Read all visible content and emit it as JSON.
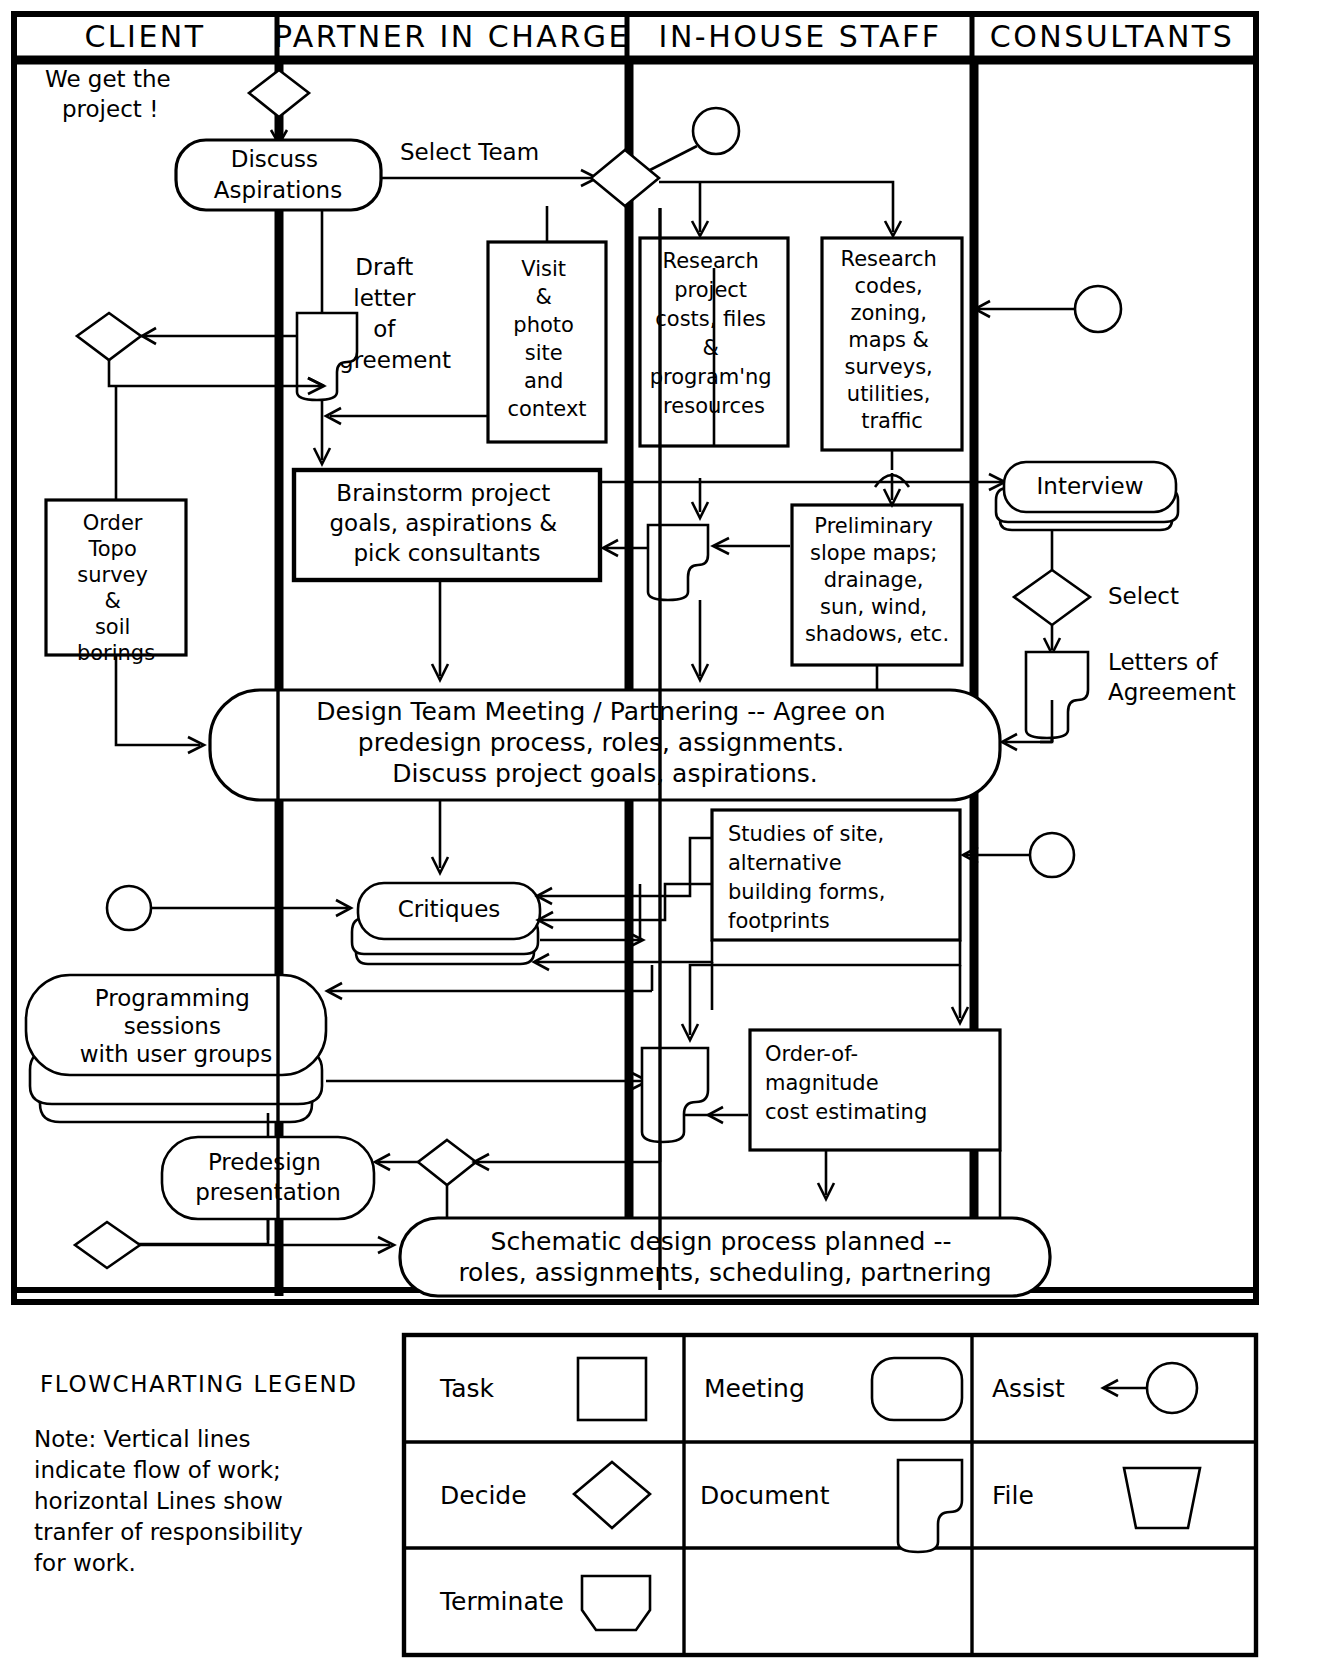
{
  "diagram": {
    "lanes": [
      {
        "id": "client",
        "label": "CLIENT"
      },
      {
        "id": "partner",
        "label": "PARTNER IN CHARGE"
      },
      {
        "id": "inhouse",
        "label": "IN-HOUSE STAFF"
      },
      {
        "id": "consultants",
        "label": "CONSULTANTS"
      }
    ],
    "nodes": {
      "we_get_project": "We get the\nproject !",
      "discuss_aspirations": "Discuss\nAspirations",
      "select_team": "Select Team",
      "draft_letter": "Draft\nletter\nof\nagreement",
      "visit_photo": "Visit\n&\nphoto\nsite\nand\ncontext",
      "research_project": "Research\nproject\ncosts, files\n&\nprogram'ng\nresources",
      "research_codes": "Research\ncodes,\nzoning,\nmaps &\nsurveys,\nutilities,\ntraffic",
      "order_topo": "Order\nTopo\nsurvey\n&\nsoil\nborings",
      "brainstorm": "Brainstorm project\ngoals, aspirations &\npick consultants",
      "preliminary_slope": "Preliminary\nslope maps;\ndrainage,\nsun, wind,\nshadows, etc.",
      "interview": "Interview",
      "select": "Select",
      "letters_of_agreement": "Letters of\nAgreement",
      "design_team_meeting": "Design Team Meeting / Partnering -- Agree on\npredesign process, roles, assignments.\nDiscuss project goals, aspirations.",
      "critiques": "Critiques",
      "studies_of_site": "Studies of site,\nalternative\nbuilding forms,\nfootprints",
      "programming_sessions": "Programming\nsessions\nwith user groups",
      "order_of_magnitude": "Order-of-\nmagnitude\ncost estimating",
      "predesign_presentation": "Predesign\npresentation",
      "schematic_design": "Schematic design process planned --\nroles, assignments, scheduling, partnering"
    }
  },
  "legend": {
    "title": "FLOWCHARTING LEGEND",
    "note": "Note: Vertical lines\nindicate flow of work;\nhorizontal Lines show\ntranfer of responsibility\nfor work.",
    "rows": [
      [
        {
          "label": "Task",
          "shape": "rectangle"
        },
        {
          "label": "Meeting",
          "shape": "rounded-rectangle"
        },
        {
          "label": "Assist",
          "shape": "arrow-circle"
        }
      ],
      [
        {
          "label": "Decide",
          "shape": "diamond"
        },
        {
          "label": "Document",
          "shape": "document"
        },
        {
          "label": "File",
          "shape": "trapezoid"
        }
      ],
      [
        {
          "label": "Terminate",
          "shape": "terminator"
        },
        {
          "label": "",
          "shape": ""
        },
        {
          "label": "",
          "shape": ""
        }
      ]
    ]
  },
  "colors": {
    "ink": "#000000",
    "paper": "#ffffff"
  }
}
